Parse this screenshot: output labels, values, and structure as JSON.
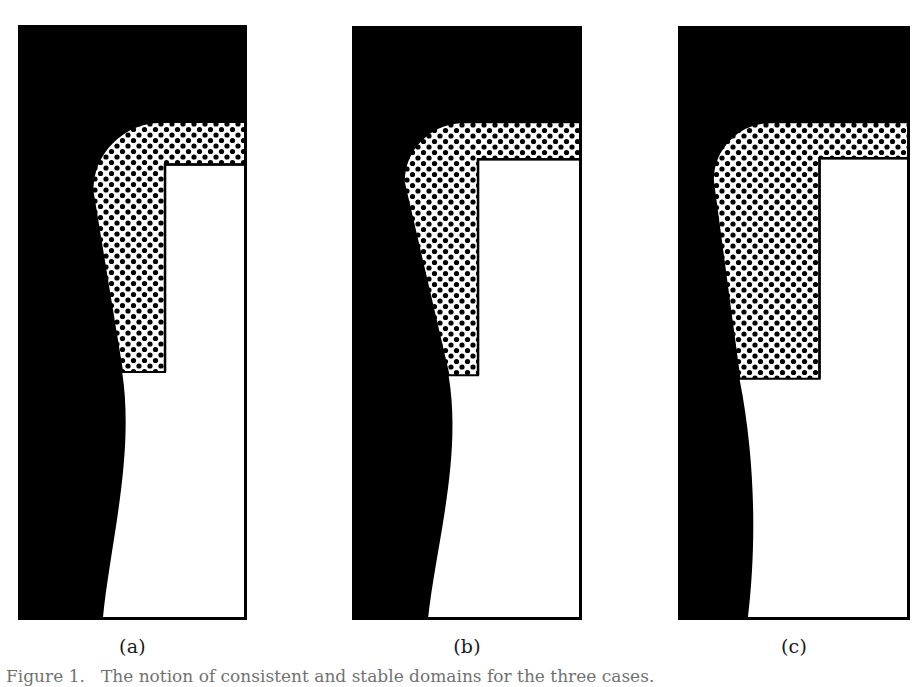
{
  "figure": {
    "caption_label": "Figure 1.",
    "caption_text": "The notion of consistent and stable domains for the three cases.",
    "background_color": "#ffffff",
    "ink_color": "#000000"
  },
  "legend_regions": {
    "black_region_name": "solid black region",
    "stipple_region_name": "dotted stippled region",
    "white_region_name": "plain white region"
  },
  "panels": [
    {
      "id": "a",
      "label": "(a)",
      "frame": {
        "x": 18,
        "y": 25,
        "width": 229,
        "height": 595
      },
      "border_width": 3,
      "white_step_corner": {
        "x": 0.642,
        "y": 0.163
      },
      "stipple_bottom": {
        "y": 0.583
      },
      "stipple_left_top": {
        "x": 0.325
      },
      "stipple_left_bottom": {
        "x": 0.455
      },
      "stipple_corner_radius": 0.3,
      "lower_black_top_x": 0.455,
      "lower_black_bottom_x": 0.37,
      "lower_black_bulge": 0.055
    },
    {
      "id": "b",
      "label": "(b)",
      "frame": {
        "x": 352,
        "y": 26,
        "width": 230,
        "height": 594
      },
      "border_width": 3,
      "white_step_corner": {
        "x": 0.548,
        "y": 0.162
      },
      "stipple_bottom": {
        "y": 0.588
      },
      "stipple_left_top": {
        "x": 0.225
      },
      "stipple_left_bottom": {
        "x": 0.42
      },
      "stipple_corner_radius": 0.26,
      "lower_black_top_x": 0.42,
      "lower_black_bottom_x": 0.33,
      "lower_black_bulge": 0.06
    },
    {
      "id": "c",
      "label": "(c)",
      "frame": {
        "x": 678,
        "y": 26,
        "width": 232,
        "height": 594
      },
      "border_width": 3,
      "white_step_corner": {
        "x": 0.61,
        "y": 0.162
      },
      "stipple_bottom": {
        "y": 0.594
      },
      "stipple_left_top": {
        "x": 0.15
      },
      "stipple_left_bottom": {
        "x": 0.265
      },
      "stipple_corner_radius": 0.25,
      "lower_black_top_x": 0.265,
      "lower_black_bottom_x": 0.3,
      "lower_black_bulge": 0.07
    }
  ],
  "stipple": {
    "dot_spacing_px": 11,
    "dot_radius_px": 2.6,
    "dot_color": "#000000",
    "field_color": "#ffffff"
  }
}
